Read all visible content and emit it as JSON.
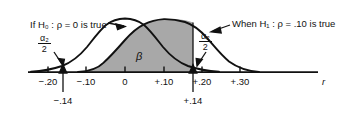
{
  "figure": {
    "type": "statistical-power-diagram",
    "background_color": "#ffffff",
    "curve_color": "#111111",
    "shade_color": "#a8a8a8",
    "labels": {
      "h0_callout": "If H₀ : ρ = 0 is true",
      "h1_callout": "When H₁ : ρ = .10 is true",
      "beta_symbol": "β",
      "alpha_left_num": "α₂",
      "alpha_left_den": "2",
      "alpha_right_num": "α₂",
      "alpha_right_den": "2",
      "axis_label": "r"
    },
    "axis": {
      "ticks": [
        {
          "label": "−.20",
          "value": -0.2,
          "x": 48
        },
        {
          "label": "−.10",
          "value": -0.1,
          "x": 86
        },
        {
          "label": "0",
          "value": 0.0,
          "x": 125
        },
        {
          "label": "+.10",
          "value": 0.1,
          "x": 164
        },
        {
          "label": "+.20",
          "value": 0.2,
          "x": 202
        },
        {
          "label": "+.30",
          "value": 0.3,
          "x": 240
        }
      ],
      "critical_values": [
        {
          "label": "−.14",
          "value": -0.14,
          "x": 63
        },
        {
          "label": "+.14",
          "value": 0.14,
          "x": 193
        }
      ]
    },
    "distributions": [
      {
        "name": "null-distribution",
        "mean": 0.0,
        "shaded": false,
        "peak_x": 125
      },
      {
        "name": "alternative-distribution",
        "mean": 0.1,
        "shaded": true,
        "peak_x": 164
      }
    ]
  }
}
